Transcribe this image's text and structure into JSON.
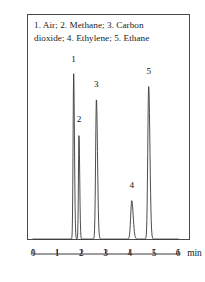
{
  "figure": {
    "caption_line1": "1. Air; 2. Methane; 3. Carbon",
    "caption_line2": "dioxide; 4. Ethylene; 5. Ethane",
    "axis_unit": "min",
    "frame_color": "#4a4a4a",
    "trace_color": "#3a3a3a"
  },
  "chart_data": {
    "type": "line",
    "title": "",
    "subtitle": "",
    "xlabel": "min",
    "ylabel": "",
    "xlim": [
      0,
      6
    ],
    "ylim": [
      0,
      1
    ],
    "grid": false,
    "legend_position": "inside-top",
    "annotations": [
      "1. Air; 2. Methane; 3. Carbon",
      "dioxide; 4. Ethylene; 5. Ethane"
    ],
    "xticks": [
      0,
      1,
      2,
      3,
      4,
      5,
      6
    ],
    "xtick_labels": [
      "0",
      "1",
      "2",
      "3",
      "4",
      "5",
      "6"
    ],
    "yticks": [],
    "ytick_labels": [],
    "series": [
      {
        "name": "chromatogram",
        "description": "gas chromatogram detector response vs retention time",
        "peaks": [
          {
            "id": 1,
            "label": "1",
            "compound": "Air",
            "retention_time": 1.68,
            "height": 0.755,
            "width": 0.055,
            "label_x": 1.68,
            "label_y": 0.8
          },
          {
            "id": 2,
            "label": "2",
            "compound": "Methane",
            "retention_time": 1.9,
            "height": 0.48,
            "width": 0.05,
            "label_x": 1.9,
            "label_y": 0.525
          },
          {
            "id": 3,
            "label": "3",
            "compound": "Carbon dioxide",
            "retention_time": 2.62,
            "height": 0.64,
            "width": 0.075,
            "label_x": 2.62,
            "label_y": 0.685
          },
          {
            "id": 4,
            "label": "4",
            "compound": "Ethylene",
            "retention_time": 4.08,
            "height": 0.175,
            "width": 0.1,
            "label_x": 4.08,
            "label_y": 0.225
          },
          {
            "id": 5,
            "label": "5",
            "compound": "Ethane",
            "retention_time": 4.78,
            "height": 0.7,
            "width": 0.085,
            "label_x": 4.78,
            "label_y": 0.745
          }
        ],
        "baseline": 0.0
      }
    ]
  }
}
